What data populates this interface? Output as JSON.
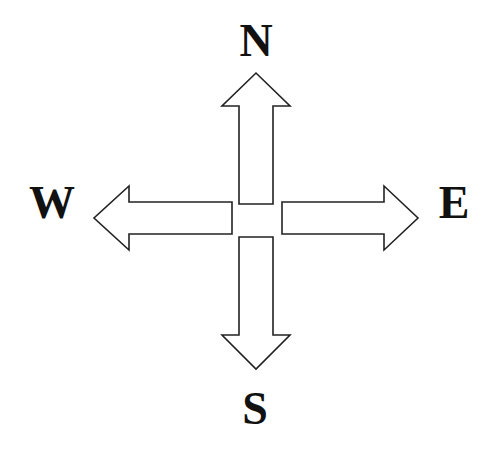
{
  "diagram": {
    "type": "compass-rose",
    "directions": [
      {
        "key": "north",
        "label": "N"
      },
      {
        "key": "east",
        "label": "E"
      },
      {
        "key": "south",
        "label": "S"
      },
      {
        "key": "west",
        "label": "W"
      }
    ],
    "colors": {
      "background": "#ffffff",
      "stroke": "#222222",
      "arrow_fill": "#ffffff",
      "text": "#111111"
    }
  }
}
